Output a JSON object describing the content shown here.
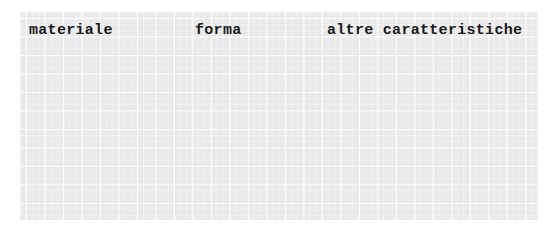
{
  "worksheet": {
    "columns": [
      {
        "label": "materiale"
      },
      {
        "label": "forma"
      },
      {
        "label": "altre caratteristiche"
      }
    ],
    "colors": {
      "background": "#e9e9e9",
      "grid_lines": "#ffffff",
      "text": "#1a1a1a"
    }
  }
}
